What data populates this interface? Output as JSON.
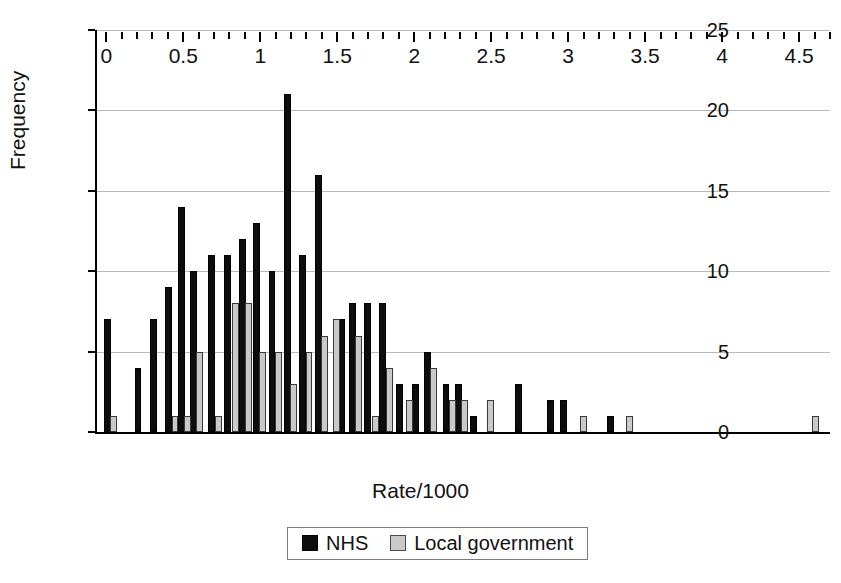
{
  "chart_data": {
    "type": "bar",
    "title": "",
    "subtitle": "",
    "xlabel": "Rate/1000",
    "ylabel": "Frequency",
    "xlim": [
      -0.06,
      4.7
    ],
    "ylim": [
      0,
      25
    ],
    "ytick_values": [
      0,
      5,
      10,
      15,
      20,
      25
    ],
    "ytick_labels": [
      "0",
      "5",
      "10",
      "15",
      "20",
      "25"
    ],
    "xtick_values": [
      0,
      0.5,
      1,
      1.5,
      2,
      2.5,
      3,
      3.5,
      4,
      4.5
    ],
    "xtick_labels": [
      "0",
      "0.5",
      "1",
      "1.5",
      "2",
      "2.5",
      "3",
      "3.5",
      "4",
      "4.5"
    ],
    "xtick_minor_step": 0.1,
    "grid": "horizontal",
    "legend_position": "bottom-center",
    "bar_width": 0.045,
    "series": [
      {
        "name": "NHS",
        "color": "#0d0d0d",
        "points": [
          {
            "x": 0.0,
            "y": 7
          },
          {
            "x": 0.2,
            "y": 4
          },
          {
            "x": 0.3,
            "y": 7
          },
          {
            "x": 0.4,
            "y": 9
          },
          {
            "x": 0.48,
            "y": 14
          },
          {
            "x": 0.56,
            "y": 10
          },
          {
            "x": 0.68,
            "y": 11
          },
          {
            "x": 0.78,
            "y": 11
          },
          {
            "x": 0.88,
            "y": 12
          },
          {
            "x": 0.97,
            "y": 13
          },
          {
            "x": 1.07,
            "y": 10
          },
          {
            "x": 1.17,
            "y": 21
          },
          {
            "x": 1.27,
            "y": 11
          },
          {
            "x": 1.37,
            "y": 16
          },
          {
            "x": 1.52,
            "y": 7
          },
          {
            "x": 1.59,
            "y": 8
          },
          {
            "x": 1.69,
            "y": 8
          },
          {
            "x": 1.79,
            "y": 8
          },
          {
            "x": 1.9,
            "y": 3
          },
          {
            "x": 2.0,
            "y": 3
          },
          {
            "x": 2.08,
            "y": 5
          },
          {
            "x": 2.2,
            "y": 3
          },
          {
            "x": 2.28,
            "y": 3
          },
          {
            "x": 2.38,
            "y": 1
          },
          {
            "x": 2.67,
            "y": 3
          },
          {
            "x": 2.88,
            "y": 2
          },
          {
            "x": 2.96,
            "y": 2
          },
          {
            "x": 3.27,
            "y": 1
          }
        ]
      },
      {
        "name": "Local government",
        "color": "#c9c9c9",
        "points": [
          {
            "x": 0.04,
            "y": 1
          },
          {
            "x": 0.44,
            "y": 1
          },
          {
            "x": 0.52,
            "y": 1
          },
          {
            "x": 0.6,
            "y": 5
          },
          {
            "x": 0.72,
            "y": 1
          },
          {
            "x": 0.83,
            "y": 8
          },
          {
            "x": 0.92,
            "y": 8
          },
          {
            "x": 1.01,
            "y": 5
          },
          {
            "x": 1.11,
            "y": 5
          },
          {
            "x": 1.21,
            "y": 3
          },
          {
            "x": 1.31,
            "y": 5
          },
          {
            "x": 1.41,
            "y": 6
          },
          {
            "x": 1.49,
            "y": 7
          },
          {
            "x": 1.63,
            "y": 6
          },
          {
            "x": 1.74,
            "y": 1
          },
          {
            "x": 1.83,
            "y": 4
          },
          {
            "x": 1.96,
            "y": 2
          },
          {
            "x": 2.12,
            "y": 4
          },
          {
            "x": 2.24,
            "y": 2
          },
          {
            "x": 2.32,
            "y": 2
          },
          {
            "x": 2.49,
            "y": 2
          },
          {
            "x": 3.09,
            "y": 1
          },
          {
            "x": 3.39,
            "y": 1
          },
          {
            "x": 4.6,
            "y": 1
          }
        ]
      }
    ]
  },
  "legend": {
    "entries": [
      {
        "label": "NHS",
        "swatch": "nhs"
      },
      {
        "label": "Local government",
        "swatch": "local"
      }
    ]
  }
}
